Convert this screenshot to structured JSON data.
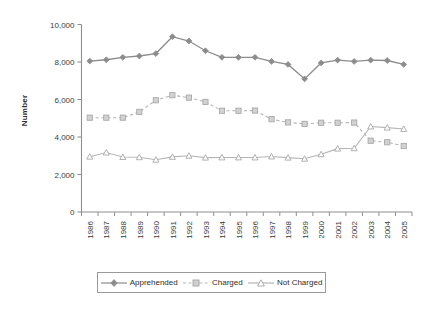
{
  "chart_data": {
    "type": "line",
    "title": "",
    "xlabel": "Year",
    "ylabel": "Number",
    "categories": [
      "1986",
      "1987",
      "1988",
      "1989",
      "1990",
      "1991",
      "1992",
      "1993",
      "1994",
      "1995",
      "1996",
      "1997",
      "1998",
      "1999",
      "2000",
      "2001",
      "2002",
      "2003",
      "2004",
      "2005"
    ],
    "ylim": [
      0,
      10000
    ],
    "ytick_values": [
      0,
      2000,
      4000,
      6000,
      8000,
      10000
    ],
    "ytick_labels": [
      "0",
      "2,000",
      "4,000",
      "6,000",
      "8,000",
      "10,000"
    ],
    "grid": false,
    "legend_position": "bottom",
    "series": [
      {
        "name": "Apprehended",
        "marker": "diamond",
        "linestyle": "solid",
        "color": "#8c8c8c",
        "values": [
          8050,
          8120,
          8250,
          8320,
          8450,
          9350,
          9120,
          8600,
          8250,
          8250,
          8250,
          8030,
          7870,
          7100,
          7950,
          8100,
          8030,
          8100,
          8080,
          7870
        ]
      },
      {
        "name": "Charged",
        "marker": "square",
        "linestyle": "dashed",
        "color": "#b5b5b5",
        "values": [
          5030,
          5030,
          5030,
          5340,
          5960,
          6230,
          6100,
          5870,
          5400,
          5400,
          5410,
          4950,
          4780,
          4700,
          4760,
          4760,
          4770,
          3800,
          3720,
          3520
        ]
      },
      {
        "name": "Not Charged",
        "marker": "triangle",
        "linestyle": "solid",
        "color": "#b5b5b5",
        "values": [
          2950,
          3170,
          2930,
          2920,
          2790,
          2940,
          3000,
          2900,
          2910,
          2910,
          2910,
          2960,
          2900,
          2840,
          3080,
          3380,
          3400,
          4560,
          4500,
          4430
        ]
      }
    ]
  },
  "axes": {
    "y_title": "Number",
    "x_title": "Year"
  },
  "legend": {
    "items": [
      {
        "label": "Apprehended"
      },
      {
        "label": "Charged"
      },
      {
        "label": "Not Charged"
      }
    ]
  }
}
